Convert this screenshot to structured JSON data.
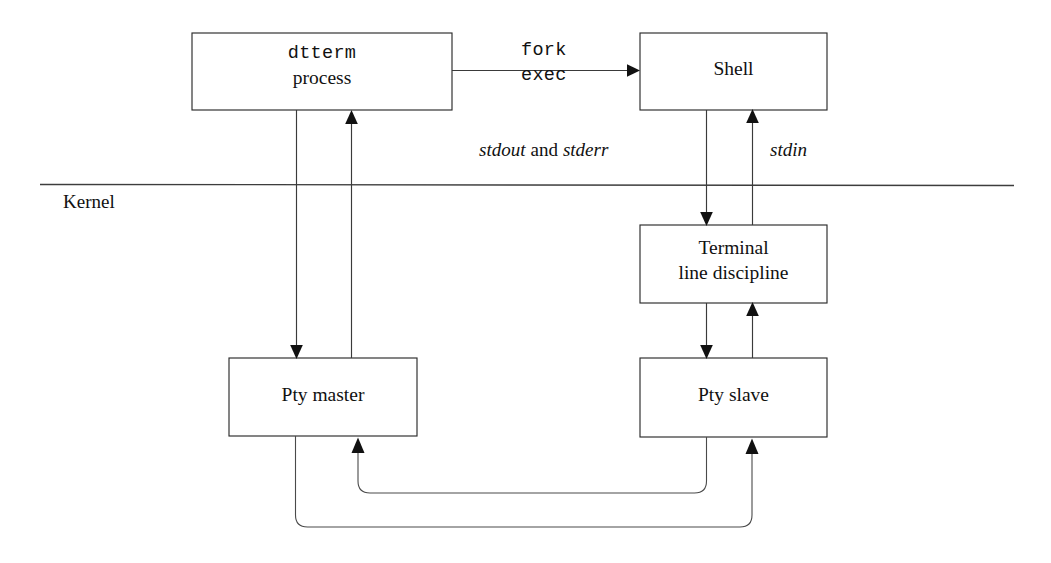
{
  "diagram": {
    "colors": {
      "background": "#ffffff",
      "stroke": "#2b2b2b",
      "connector": "#3a3a3a",
      "text": "#111111"
    },
    "boxes": [
      {
        "name": "dtterm-process",
        "line1": "dtterm",
        "line2": "process",
        "line1_style": "mono",
        "line2_style": "serif"
      },
      {
        "name": "shell",
        "line1": "Shell",
        "line1_style": "serif"
      },
      {
        "name": "terminal-line-discipline",
        "line1": "Terminal",
        "line2": "line discipline",
        "line1_style": "serif",
        "line2_style": "serif"
      },
      {
        "name": "pty-master",
        "line1": "Pty master",
        "line1_style": "serif"
      },
      {
        "name": "pty-slave",
        "line1": "Pty slave",
        "line1_style": "serif"
      }
    ],
    "edge_labels": {
      "fork": "fork",
      "exec": "exec",
      "stdout": "stdout",
      "and": "and",
      "stderr": "stderr",
      "stdin": "stdin"
    },
    "kernel_label": "Kernel"
  }
}
